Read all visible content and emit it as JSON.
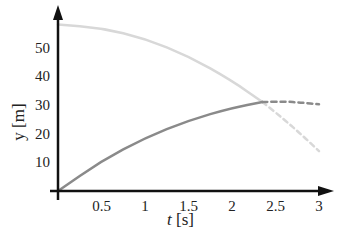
{
  "chart_data": {
    "type": "line",
    "title": "",
    "xlabel": "t [s]",
    "ylabel": "y [m]",
    "xlim": [
      0,
      3.1
    ],
    "ylim": [
      0,
      62
    ],
    "grid": false,
    "legend": null,
    "x_ticks": [
      "0.5",
      "1",
      "1.5",
      "2",
      "2.5",
      "3"
    ],
    "y_ticks": [
      "10",
      "20",
      "30",
      "40",
      "50"
    ],
    "series": [
      {
        "name": "falling object (light)",
        "color": "#d8d8d8",
        "solid": {
          "x": [
            0,
            0.5,
            1.0,
            1.5,
            2.0,
            2.35
          ],
          "y": [
            58,
            56.8,
            53.1,
            47.0,
            38.4,
            31.0
          ]
        },
        "dashed": {
          "x": [
            2.35,
            2.6,
            2.8,
            3.0
          ],
          "y": [
            31.0,
            24.9,
            19.6,
            13.9
          ]
        }
      },
      {
        "name": "rising object (dark)",
        "color": "#8a8a8a",
        "solid": {
          "x": [
            0,
            0.5,
            1.0,
            1.5,
            2.0,
            2.35
          ],
          "y": [
            0,
            10.5,
            18.5,
            24.6,
            29.0,
            31.0
          ]
        },
        "dashed": {
          "x": [
            2.35,
            2.6,
            2.8,
            3.0
          ],
          "y": [
            31.0,
            31.2,
            30.8,
            30.2
          ]
        }
      }
    ]
  },
  "axes": {
    "x_label_t": "t",
    "x_label_unit": " [s]",
    "y_label": "y [m]"
  }
}
